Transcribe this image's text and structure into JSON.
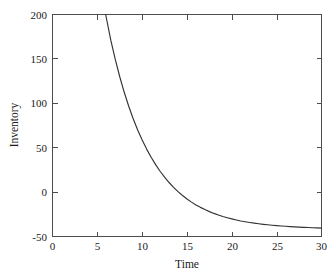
{
  "chart_data": {
    "type": "line",
    "title": "",
    "subtitle": "",
    "xlabel": "Time",
    "ylabel": "Inventory",
    "xlim": [
      0,
      30
    ],
    "ylim": [
      -50,
      200
    ],
    "xticks": [
      0,
      5,
      10,
      15,
      20,
      25,
      30
    ],
    "xtick_labels": [
      "0",
      "5",
      "10",
      "15",
      "20",
      "25",
      "30"
    ],
    "yticks": [
      -50,
      0,
      50,
      100,
      150,
      200
    ],
    "ytick_labels": [
      "-50",
      "0",
      "50",
      "100",
      "150",
      "200"
    ],
    "grid": false,
    "legend": false,
    "legend_position": "none",
    "series": [
      {
        "name": "Inventory",
        "color": "#333333",
        "line_width": 1.15,
        "model": "exponential decay to asymptote: y = 1700 * exp(-0.2166 * t) - 50",
        "asymptote": -50,
        "enters_top_at_x": 5.93,
        "zero_crossing_x": 16.3,
        "x": [
          5.93,
          6.5,
          7,
          7.5,
          8,
          8.5,
          9,
          9.5,
          10,
          10.5,
          11,
          11.5,
          12,
          12.5,
          13,
          13.5,
          14,
          14.5,
          15,
          15.5,
          16,
          16.5,
          17,
          17.5,
          18,
          18.5,
          19,
          19.5,
          20,
          20.5,
          21,
          21.5,
          22,
          22.5,
          23,
          23.5,
          24,
          24.5,
          25,
          25.5,
          26,
          26.5,
          27,
          27.5,
          28,
          28.5,
          29,
          29.5,
          30
        ],
        "y": [
          200,
          171.1,
          149.4,
          129.9,
          112.4,
          96.7,
          82.6,
          70,
          58.6,
          48.4,
          39.2,
          30.9,
          23.5,
          16.8,
          10.8,
          5.4,
          0.5,
          -3.8,
          -7.7,
          -11.3,
          -14.4,
          -17.2,
          -19.7,
          -22,
          -24,
          -25.8,
          -27.5,
          -28.9,
          -30.2,
          -31.4,
          -32.5,
          -33.4,
          -34.2,
          -35,
          -35.7,
          -36.3,
          -36.8,
          -37.3,
          -37.8,
          -38.2,
          -38.5,
          -38.9,
          -39.2,
          -39.4,
          -39.7,
          -39.9,
          -40.1,
          -40.3,
          -40.5
        ]
      }
    ]
  }
}
